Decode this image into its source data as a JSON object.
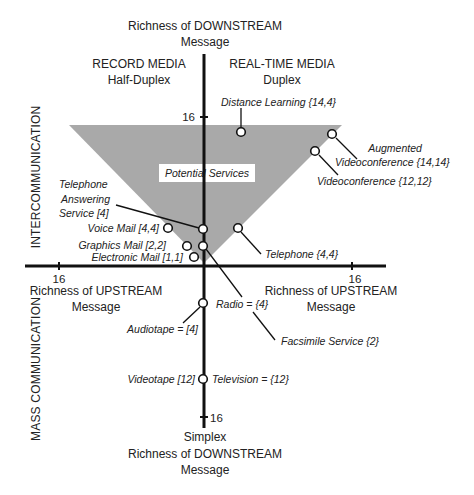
{
  "diagram": {
    "top_axis_title": [
      "Richness of DOWNSTREAM",
      "Message"
    ],
    "bottom_axis_title": [
      "Simplex",
      "Richness of DOWNSTREAM",
      "Message"
    ],
    "left_axis_title": [
      "Richness of UPSTREAM",
      "Message"
    ],
    "right_axis_title": [
      "Richness of UPSTREAM",
      "Message"
    ],
    "quadrant_left": [
      "RECORD MEDIA",
      "Half-Duplex"
    ],
    "quadrant_right": [
      "REAL-TIME MEDIA",
      "Duplex"
    ],
    "side_top": "INTERCOMMUNICATION",
    "side_bottom": "MASS COMMUNICATION",
    "tick_labels": {
      "top": "16",
      "bottom": "16",
      "left": "16",
      "right": "16"
    },
    "region_label": "Potential Services",
    "region_fill": "#a9a9a9",
    "nodes": [
      {
        "id": "distance-learning",
        "label": "Distance Learning {14,4}"
      },
      {
        "id": "augmented-videoconference",
        "label_lines": [
          "Augmented",
          "Videoconference {14,14}"
        ]
      },
      {
        "id": "videoconference",
        "label": "Videoconference {12,12}"
      },
      {
        "id": "telephone-answering-service",
        "label_lines": [
          "Telephone",
          "Answering",
          "Service [4]"
        ]
      },
      {
        "id": "voice-mail",
        "label": "Voice Mail [4,4]"
      },
      {
        "id": "graphics-mail",
        "label": "Graphics Mail [2,2]"
      },
      {
        "id": "electronic-mail",
        "label": "Electronic Mail [1,1]"
      },
      {
        "id": "telephone",
        "label": "Telephone {4,4}"
      },
      {
        "id": "radio",
        "label": "Radio = {4}"
      },
      {
        "id": "audiotape",
        "label": "Audiotape = [4]"
      },
      {
        "id": "facsimile",
        "label": "Facsimile Service {2}"
      },
      {
        "id": "videotape",
        "label": "Videotape [12]"
      },
      {
        "id": "television",
        "label": "Television = {12}"
      }
    ]
  }
}
